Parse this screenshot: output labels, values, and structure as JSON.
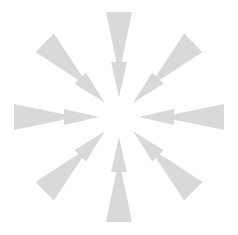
{
  "canvas": {
    "width": 238,
    "height": 235,
    "background_color": "#ffffff"
  },
  "graphic": {
    "name": "radial-loading-spinner",
    "description": "Eight-spoke radial busy indicator composed of paired tapered triangular wedges",
    "shape_type": "triangle-wedge",
    "fill_color": "#d9d9d9",
    "spoke_count": 8,
    "center_x": 119,
    "center_y": 117,
    "hub_empty": true,
    "angle_step_degrees": 45,
    "angles_degrees": [
      0,
      45,
      90,
      135,
      180,
      225,
      270,
      315
    ],
    "outer_wedge": {
      "inner_radius": 42,
      "outer_radius": 105,
      "base_half_width": 13,
      "apex_at": "inner"
    },
    "inner_wedge": {
      "inner_radius": 20,
      "outer_radius": 55,
      "base_half_width": 8,
      "apex_at": "inner"
    },
    "spoke_labels": [
      "spoke-top",
      "spoke-top-right",
      "spoke-right",
      "spoke-bottom-right",
      "spoke-bottom",
      "spoke-bottom-left",
      "spoke-left",
      "spoke-top-left"
    ]
  }
}
